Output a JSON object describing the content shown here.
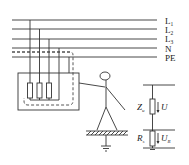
{
  "diagram": {
    "type": "TN-S fault touch-voltage circuit",
    "conductors": [
      {
        "id": "L1",
        "label": "L",
        "sub": "1",
        "y": 20
      },
      {
        "id": "L2",
        "label": "L",
        "sub": "2",
        "y": 29
      },
      {
        "id": "L3",
        "label": "L",
        "sub": "3",
        "y": 39
      },
      {
        "id": "N",
        "label": "N",
        "sub": "",
        "y": 48
      },
      {
        "id": "PE",
        "label": "PE",
        "sub": "",
        "y": 57
      }
    ],
    "equivalent_circuit": {
      "upper_impedance": {
        "symbol": "Z",
        "sub": "u",
        "voltage": "U",
        "voltage_sub": ""
      },
      "lower_resistance": {
        "symbol": "R",
        "sub": "s",
        "voltage": "U",
        "voltage_sub": "R"
      }
    },
    "colors": {
      "stroke": "#333333",
      "text": "#222222",
      "background": "#ffffff"
    }
  }
}
